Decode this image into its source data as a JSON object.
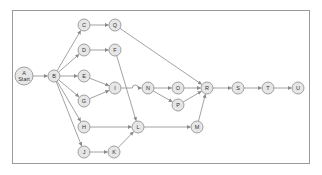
{
  "diagram": {
    "type": "network-precedence-diagram",
    "style": {
      "node_fill": "#e6e6e6",
      "node_stroke": "#8a8a8a",
      "edge_color": "#8a8a8a",
      "text_color": "#333333",
      "frame_color": "#9a9a9a"
    },
    "nodes": [
      {
        "id": "A",
        "label": "A",
        "sublabel": "Start",
        "x": 24,
        "y": 76,
        "r": 9
      },
      {
        "id": "B",
        "label": "B",
        "x": 54,
        "y": 76,
        "r": 6
      },
      {
        "id": "C",
        "label": "C",
        "x": 84,
        "y": 25,
        "r": 6
      },
      {
        "id": "Q",
        "label": "Q",
        "x": 115,
        "y": 25,
        "r": 6
      },
      {
        "id": "D",
        "label": "D",
        "x": 84,
        "y": 50,
        "r": 6
      },
      {
        "id": "F",
        "label": "F",
        "x": 115,
        "y": 50,
        "r": 6
      },
      {
        "id": "E",
        "label": "E",
        "x": 84,
        "y": 76,
        "r": 6
      },
      {
        "id": "I",
        "label": "I",
        "x": 115,
        "y": 88,
        "r": 6
      },
      {
        "id": "G",
        "label": "G",
        "x": 84,
        "y": 101,
        "r": 6
      },
      {
        "id": "H",
        "label": "H",
        "x": 84,
        "y": 127,
        "r": 6
      },
      {
        "id": "L",
        "label": "L",
        "x": 138,
        "y": 127,
        "r": 6
      },
      {
        "id": "M",
        "label": "M",
        "x": 197,
        "y": 127,
        "r": 6
      },
      {
        "id": "J",
        "label": "J",
        "x": 84,
        "y": 152,
        "r": 6
      },
      {
        "id": "K",
        "label": "K",
        "x": 114,
        "y": 152,
        "r": 6
      },
      {
        "id": "N",
        "label": "N",
        "x": 148,
        "y": 88,
        "r": 6
      },
      {
        "id": "O",
        "label": "O",
        "x": 178,
        "y": 88,
        "r": 6
      },
      {
        "id": "P",
        "label": "P",
        "x": 178,
        "y": 105,
        "r": 6
      },
      {
        "id": "R",
        "label": "R",
        "x": 207,
        "y": 88,
        "r": 6
      },
      {
        "id": "S",
        "label": "S",
        "x": 238,
        "y": 88,
        "r": 6
      },
      {
        "id": "T",
        "label": "T",
        "x": 268,
        "y": 88,
        "r": 6
      },
      {
        "id": "U",
        "label": "U",
        "x": 298,
        "y": 88,
        "r": 6
      }
    ],
    "edges": [
      {
        "from": "A",
        "to": "B"
      },
      {
        "from": "B",
        "to": "C"
      },
      {
        "from": "B",
        "to": "D"
      },
      {
        "from": "B",
        "to": "E"
      },
      {
        "from": "B",
        "to": "G"
      },
      {
        "from": "B",
        "to": "H"
      },
      {
        "from": "B",
        "to": "J"
      },
      {
        "from": "C",
        "to": "Q"
      },
      {
        "from": "D",
        "to": "F"
      },
      {
        "from": "E",
        "to": "I"
      },
      {
        "from": "G",
        "to": "I"
      },
      {
        "from": "Q",
        "to": "R"
      },
      {
        "from": "F",
        "to": "L"
      },
      {
        "from": "I",
        "to": "N",
        "hop": true
      },
      {
        "from": "H",
        "to": "L"
      },
      {
        "from": "J",
        "to": "K"
      },
      {
        "from": "K",
        "to": "L"
      },
      {
        "from": "L",
        "to": "M"
      },
      {
        "from": "N",
        "to": "O"
      },
      {
        "from": "N",
        "to": "P"
      },
      {
        "from": "O",
        "to": "R"
      },
      {
        "from": "P",
        "to": "R"
      },
      {
        "from": "M",
        "to": "R"
      },
      {
        "from": "R",
        "to": "S"
      },
      {
        "from": "S",
        "to": "T"
      },
      {
        "from": "T",
        "to": "U"
      }
    ]
  }
}
